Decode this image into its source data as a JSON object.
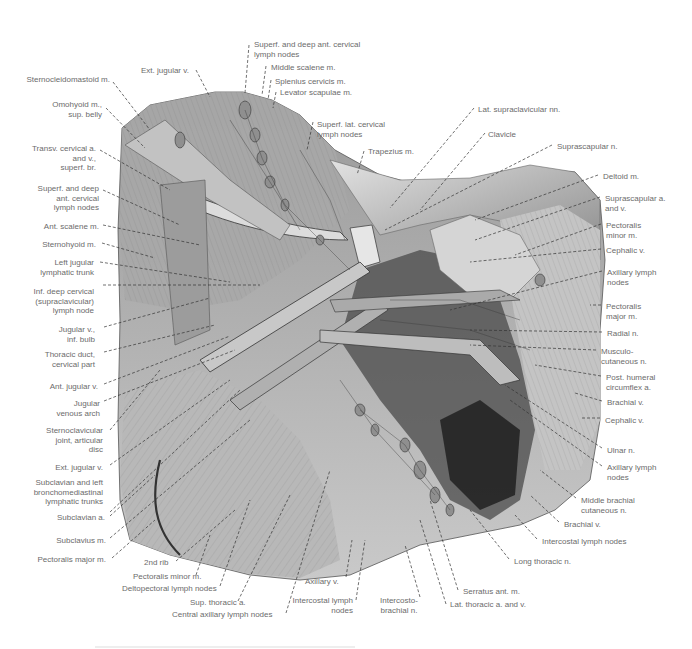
{
  "figure": {
    "colors": {
      "background": "#ffffff",
      "label_text": "#6b6b6b",
      "leader_lines": "#333333",
      "illustration_mid": "#9a9a9a",
      "illustration_dark": "#2a2a2a",
      "illustration_light": "#d8d8d8"
    }
  },
  "labels": {
    "left": [
      {
        "text": "Sternocleidomastoid m.",
        "x": 20,
        "y": 79
      },
      {
        "text": "Omohyoid m.,\nsup. belly",
        "x": 40,
        "y": 105
      },
      {
        "text": "Transv. cervical a.\nand v.,\nsuperf. br.",
        "x": 28,
        "y": 147
      },
      {
        "text": "Superf. and deep\nant. cervical\nlymph nodes",
        "x": 33,
        "y": 184
      },
      {
        "text": "Ant. scalene m.",
        "x": 40,
        "y": 222
      },
      {
        "text": "Sternohyoid m.",
        "x": 38,
        "y": 240
      },
      {
        "text": "Left jugular\nlymphatic trunk",
        "x": 38,
        "y": 259
      },
      {
        "text": "Inf. deep cervical\n(supraclavicular)\nlymph node",
        "x": 30,
        "y": 287
      },
      {
        "text": "Jugular v.,\ninf. bulb",
        "x": 58,
        "y": 325
      },
      {
        "text": "Thoracic duct,\ncervical part",
        "x": 48,
        "y": 350
      },
      {
        "text": "Ant. jugular v.",
        "x": 50,
        "y": 382
      },
      {
        "text": "Jugular\nvenous arch",
        "x": 52,
        "y": 400
      },
      {
        "text": "Sternoclavicular\njoint, articular\ndisc",
        "x": 45,
        "y": 426
      },
      {
        "text": "Ext. jugular v.",
        "x": 55,
        "y": 465
      },
      {
        "text": "Subclavian and left\nbronchomediastinal\nlymphatic trunks",
        "x": 33,
        "y": 480
      },
      {
        "text": "Subclavian a.",
        "x": 58,
        "y": 514
      },
      {
        "text": "Subclavius m.",
        "x": 56,
        "y": 536
      },
      {
        "text": "Pectoralis major m.",
        "x": 38,
        "y": 556
      }
    ],
    "top": [
      {
        "text": "Ext. jugular v.",
        "x": 141,
        "y": 66
      },
      {
        "text": "Superf. and deep ant. cervical\nlymph nodes",
        "x": 254,
        "y": 40
      },
      {
        "text": "Middle scalene m.",
        "x": 271,
        "y": 64
      },
      {
        "text": "Splenius cervicis m.",
        "x": 275,
        "y": 78
      },
      {
        "text": "Levator scapulae m.",
        "x": 280,
        "y": 90
      },
      {
        "text": "Superf. lat. cervical\nlymph nodes",
        "x": 317,
        "y": 120
      },
      {
        "text": "Trapezius m.",
        "x": 368,
        "y": 147
      }
    ],
    "right": [
      {
        "text": "Lat. supraclavicular nn.",
        "x": 478,
        "y": 105
      },
      {
        "text": "Clavicle",
        "x": 488,
        "y": 130
      },
      {
        "text": "Suprascapular n.",
        "x": 557,
        "y": 142
      },
      {
        "text": "Deltoid m.",
        "x": 603,
        "y": 172
      },
      {
        "text": "Suprascapular a.\nand v.",
        "x": 605,
        "y": 194
      },
      {
        "text": "Pectoralis\nminor m.",
        "x": 606,
        "y": 221
      },
      {
        "text": "Cephalic v.",
        "x": 606,
        "y": 246
      },
      {
        "text": "Axillary lymph\nnodes",
        "x": 607,
        "y": 268
      },
      {
        "text": "Pectoralis\nmajor m.",
        "x": 606,
        "y": 302
      },
      {
        "text": "Radial n.",
        "x": 607,
        "y": 329
      },
      {
        "text": "Musculo-\ncutaneous n.",
        "x": 601,
        "y": 347
      },
      {
        "text": "Post. humeral\ncircumflex a.",
        "x": 606,
        "y": 373
      },
      {
        "text": "Brachial v.",
        "x": 607,
        "y": 398
      },
      {
        "text": "Cephalic v.",
        "x": 605,
        "y": 416
      },
      {
        "text": "Ulnar n.",
        "x": 607,
        "y": 446
      },
      {
        "text": "Axillary lymph\nnodes",
        "x": 607,
        "y": 463
      },
      {
        "text": "Middle brachial\ncutaneous n.",
        "x": 581,
        "y": 496
      },
      {
        "text": "Brachial v.",
        "x": 564,
        "y": 520
      },
      {
        "text": "Intercostal lymph nodes",
        "x": 542,
        "y": 537
      },
      {
        "text": "Long thoracic n.",
        "x": 514,
        "y": 557
      }
    ],
    "bottom": [
      {
        "text": "2nd rib",
        "x": 144,
        "y": 558
      },
      {
        "text": "Pectoralis minor m.",
        "x": 133,
        "y": 572
      },
      {
        "text": "Deltopectoral lymph nodes",
        "x": 122,
        "y": 584
      },
      {
        "text": "Sup. thoracic a.",
        "x": 190,
        "y": 598
      },
      {
        "text": "Central axillary lymph nodes",
        "x": 172,
        "y": 610
      },
      {
        "text": "Axillary v.",
        "x": 305,
        "y": 577
      },
      {
        "text": "Intercostal lymph\nnodes",
        "x": 291,
        "y": 597
      },
      {
        "text": "Intercosto-\nbrachial n.",
        "x": 380,
        "y": 597
      },
      {
        "text": "Serratus ant. m.",
        "x": 463,
        "y": 587
      },
      {
        "text": "Lat. thoracic a. and v.",
        "x": 450,
        "y": 600
      }
    ]
  }
}
